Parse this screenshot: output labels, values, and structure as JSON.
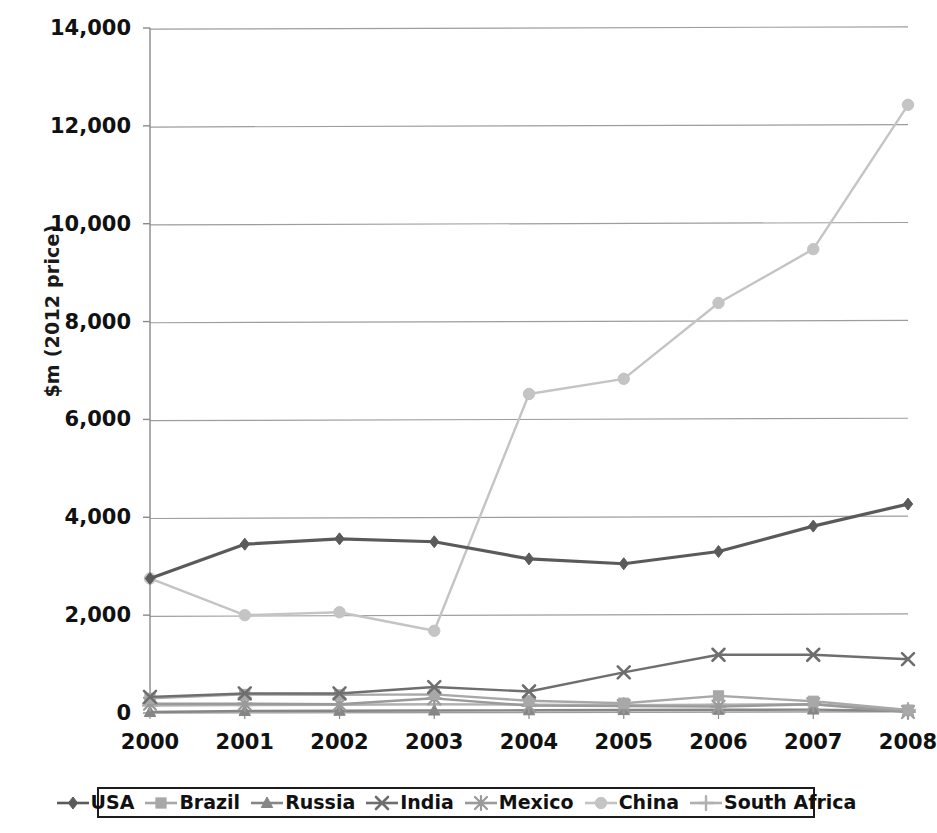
{
  "chart_data": {
    "type": "line",
    "title": "",
    "subtitle": "",
    "xlabel": "",
    "ylabel": "$m (2012 price)",
    "categories": [
      "2000",
      "2001",
      "2002",
      "2003",
      "2004",
      "2005",
      "2006",
      "2007",
      "2008"
    ],
    "x": [
      2000,
      2001,
      2002,
      2003,
      2004,
      2005,
      2006,
      2007,
      2008
    ],
    "ylim": [
      0,
      14000
    ],
    "yticks": [
      0,
      2000,
      4000,
      6000,
      8000,
      10000,
      12000,
      14000
    ],
    "ytick_labels": [
      "0",
      "2,000",
      "4,000",
      "6,000",
      "8,000",
      "10,000",
      "12,000",
      "14,000"
    ],
    "grid": true,
    "legend_position": "bottom",
    "series": [
      {
        "name": "USA",
        "marker": "diamond",
        "color": "#5a5a5a",
        "values": [
          2750,
          3450,
          3560,
          3500,
          3150,
          3050,
          3300,
          3820,
          4270
        ]
      },
      {
        "name": "Brazil",
        "marker": "square",
        "color": "#a8a8a8",
        "values": [
          300,
          380,
          370,
          380,
          250,
          200,
          350,
          240,
          60
        ]
      },
      {
        "name": "Russia",
        "marker": "triangle",
        "color": "#868686",
        "values": [
          20,
          40,
          45,
          50,
          55,
          60,
          65,
          70,
          40
        ]
      },
      {
        "name": "India",
        "marker": "x",
        "color": "#6e6e6e",
        "values": [
          330,
          400,
          400,
          530,
          440,
          830,
          1190,
          1190,
          1100
        ]
      },
      {
        "name": "Mexico",
        "marker": "asterisk",
        "color": "#9a9a9a",
        "values": [
          190,
          190,
          180,
          300,
          150,
          140,
          130,
          180,
          20
        ]
      },
      {
        "name": "China",
        "marker": "circle",
        "color": "#c4c4c4",
        "values": [
          2750,
          2000,
          2060,
          1680,
          6520,
          6830,
          8380,
          9480,
          12430
        ]
      },
      {
        "name": "South Africa",
        "marker": "plus",
        "color": "#b0b0b0",
        "values": [
          150,
          160,
          170,
          180,
          170,
          160,
          170,
          180,
          60
        ]
      }
    ]
  },
  "legend": {
    "items": [
      {
        "label": "USA",
        "marker": "diamond",
        "color": "#5a5a5a"
      },
      {
        "label": "Brazil",
        "marker": "square",
        "color": "#a8a8a8"
      },
      {
        "label": "Russia",
        "marker": "triangle",
        "color": "#868686"
      },
      {
        "label": "India",
        "marker": "x",
        "color": "#6e6e6e"
      },
      {
        "label": "Mexico",
        "marker": "asterisk",
        "color": "#9a9a9a"
      },
      {
        "label": "China",
        "marker": "circle",
        "color": "#c4c4c4"
      },
      {
        "label": "South Africa",
        "marker": "plus",
        "color": "#b0b0b0"
      }
    ]
  },
  "style": {
    "gridline_color": "#9d9d9d",
    "axis_color": "#8a8a8a",
    "text_color": "#111111",
    "background": "#ffffff"
  }
}
